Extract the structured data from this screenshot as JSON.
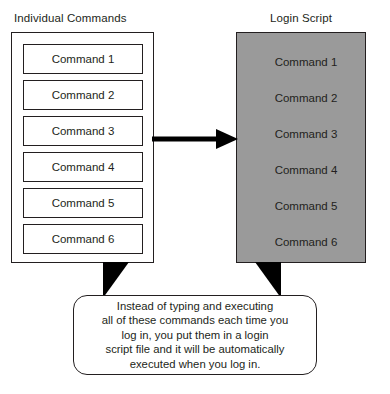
{
  "diagram": {
    "left_panel": {
      "title": "Individual Commands",
      "commands": [
        "Command 1",
        "Command 2",
        "Command 3",
        "Command 4",
        "Command 5",
        "Command 6"
      ]
    },
    "right_panel": {
      "title": "Login Script",
      "fill_color": "#9a9a9a",
      "commands": [
        "Command 1",
        "Command 2",
        "Command 3",
        "Command 4",
        "Command 5",
        "Command 6"
      ]
    },
    "arrow": {
      "name": "flow-arrow",
      "direction": "right"
    },
    "callout": {
      "text": "Instead of typing and executing\nall of these commands each time you\nlog in, you put them in a login\nscript file and it will be automatically\nexecuted when you log in."
    }
  }
}
